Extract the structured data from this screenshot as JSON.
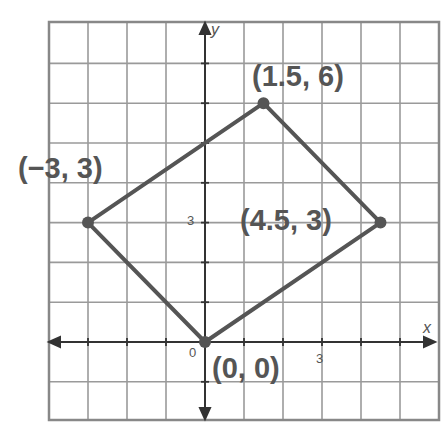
{
  "chart_data": {
    "type": "scatter",
    "subtype": "polygon-on-coordinate-grid",
    "title": "",
    "xlabel": "x",
    "ylabel": "y",
    "xlim": [
      -4,
      6
    ],
    "ylim": [
      -2,
      8
    ],
    "grid": true,
    "grid_step": 1,
    "tick_labels": {
      "x": [
        "0",
        "3"
      ],
      "y": [
        "3"
      ]
    },
    "series": [
      {
        "name": "quadrilateral",
        "closed": true,
        "points": [
          {
            "x": 0,
            "y": 0,
            "label": "(0, 0)"
          },
          {
            "x": -3,
            "y": 3,
            "label": "(−3, 3)"
          },
          {
            "x": 1.5,
            "y": 6,
            "label": "(1.5, 6)"
          },
          {
            "x": 4.5,
            "y": 3,
            "label": "(4.5, 3)"
          }
        ]
      }
    ],
    "colors": {
      "line": "#555555",
      "grid": "#9a9a9a",
      "axis": "#333333",
      "text": "#555555"
    }
  },
  "labels": {
    "p_origin": "(0, 0)",
    "p_left": "(−3, 3)",
    "p_top": "(1.5, 6)",
    "p_right": "(4.5, 3)",
    "tick_origin": "0",
    "tick_x3": "3",
    "tick_y3": "3",
    "axis_x": "x",
    "axis_y": "y"
  }
}
